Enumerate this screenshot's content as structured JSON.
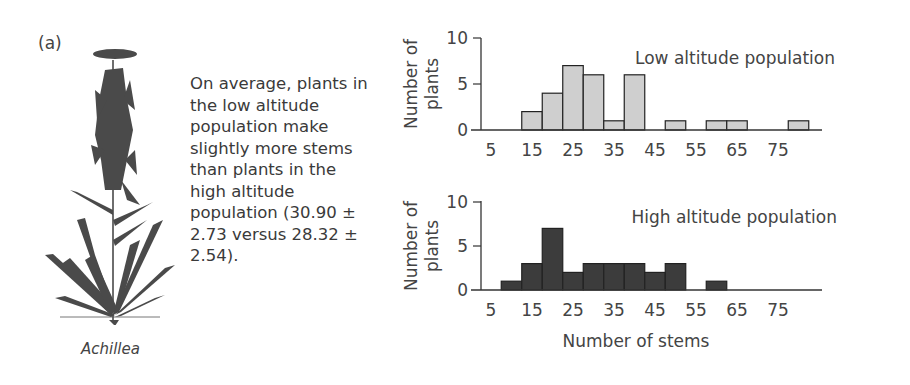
{
  "figure": {
    "panel_label": "(a)",
    "species_label": "Achillea",
    "caption": "On average, plants in the low altitude population make slightly more stems than plants in the high altitude population (30.90 ± 2.73 versus 28.32 ± 2.54).",
    "colors": {
      "low_bar_fill": "#cfcfcf",
      "high_bar_fill": "#3c3c3c",
      "bar_edge": "#222222",
      "axis": "#333333",
      "plant": "#4a4a4a"
    }
  },
  "chart_data": [
    {
      "type": "bar",
      "title": "Low altitude population",
      "xlabel": "",
      "ylabel": "Number of plants",
      "x_ticks": [
        5,
        15,
        25,
        35,
        45,
        55,
        65,
        75
      ],
      "y_ticks": [
        0,
        5,
        10
      ],
      "ylim": [
        0,
        10
      ],
      "bin_width": 5,
      "categories": [
        15,
        20,
        25,
        30,
        35,
        40,
        50,
        60,
        65,
        80
      ],
      "values": [
        2,
        4,
        7,
        6,
        1,
        6,
        1,
        1,
        1,
        1
      ],
      "grid": false
    },
    {
      "type": "bar",
      "title": "High altitude population",
      "xlabel": "Number of stems",
      "ylabel": "Number of plants",
      "x_ticks": [
        5,
        15,
        25,
        35,
        45,
        55,
        65,
        75
      ],
      "y_ticks": [
        0,
        5,
        10
      ],
      "ylim": [
        0,
        10
      ],
      "bin_width": 5,
      "categories": [
        10,
        15,
        20,
        25,
        30,
        35,
        40,
        45,
        50,
        60
      ],
      "values": [
        1,
        3,
        7,
        2,
        3,
        3,
        3,
        2,
        3,
        1
      ],
      "grid": false
    }
  ]
}
